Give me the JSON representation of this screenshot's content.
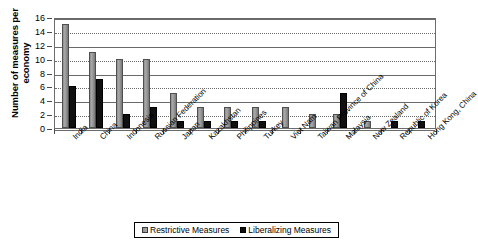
{
  "chart_data": {
    "type": "bar",
    "title": "",
    "xlabel": "",
    "ylabel": "Number of measures per economy",
    "ylim": [
      0,
      16
    ],
    "yticks": [
      0,
      2,
      4,
      6,
      8,
      10,
      12,
      14,
      16
    ],
    "grid": true,
    "legend_position": "bottom-center",
    "categories": [
      "India",
      "China",
      "Indonesia",
      "Russian Federation",
      "Japan",
      "Kazakhstan",
      "Philippines",
      "Turkey",
      "Viet Nam",
      "Taiwan Province of China",
      "Malaysia",
      "New Zealand",
      "Republic of Korea",
      "Hong Kong, China"
    ],
    "series": [
      {
        "name": "Restrictive Measures",
        "color": "#9a9a9a",
        "values": [
          15,
          11,
          10,
          10,
          5,
          3,
          3,
          3,
          3,
          2,
          2,
          1,
          0,
          0
        ]
      },
      {
        "name": "Liberalizing Measures",
        "color": "#101010",
        "values": [
          6,
          7,
          2,
          3,
          1,
          1,
          1,
          1,
          0,
          0,
          5,
          0,
          1,
          1
        ]
      }
    ]
  },
  "legend": {
    "items": [
      {
        "label": "Restrictive Measures"
      },
      {
        "label": "Liberalizing Measures"
      }
    ]
  }
}
